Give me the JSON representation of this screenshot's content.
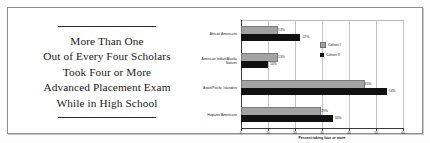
{
  "pull_quote": {
    "lines": [
      "More Than One",
      "Out of Every Four Scholars",
      "Took Four or More",
      "Advanced Placement Exam",
      "While in High School"
    ]
  },
  "chart_data": {
    "type": "bar",
    "orientation": "horizontal",
    "title": "",
    "xlabel": "Percent taking four or more",
    "ylabel": "",
    "xlim": [
      0,
      60
    ],
    "xticks": [
      0,
      10,
      20,
      30,
      40,
      50,
      60
    ],
    "xtick_labels": [
      "0",
      "10",
      "20",
      "30",
      "40",
      "50",
      "60"
    ],
    "grid": true,
    "legend_position": "upper-right-inside",
    "categories": [
      "African Americans",
      "American Indian/Alaska Natives",
      "Asian/Pacific Islanders",
      "Hispanic Americans"
    ],
    "series": [
      {
        "name": "Cohort I",
        "color": "#a3a3a3",
        "values": [
          13,
          13,
          45,
          29
        ],
        "labels": [
          "13%",
          "13%",
          "45%",
          "29%"
        ]
      },
      {
        "name": "Cohort II",
        "color": "#111111",
        "values": [
          22,
          10,
          54,
          34
        ],
        "labels": [
          "22%",
          "10%",
          "54%",
          "34%"
        ]
      }
    ]
  }
}
